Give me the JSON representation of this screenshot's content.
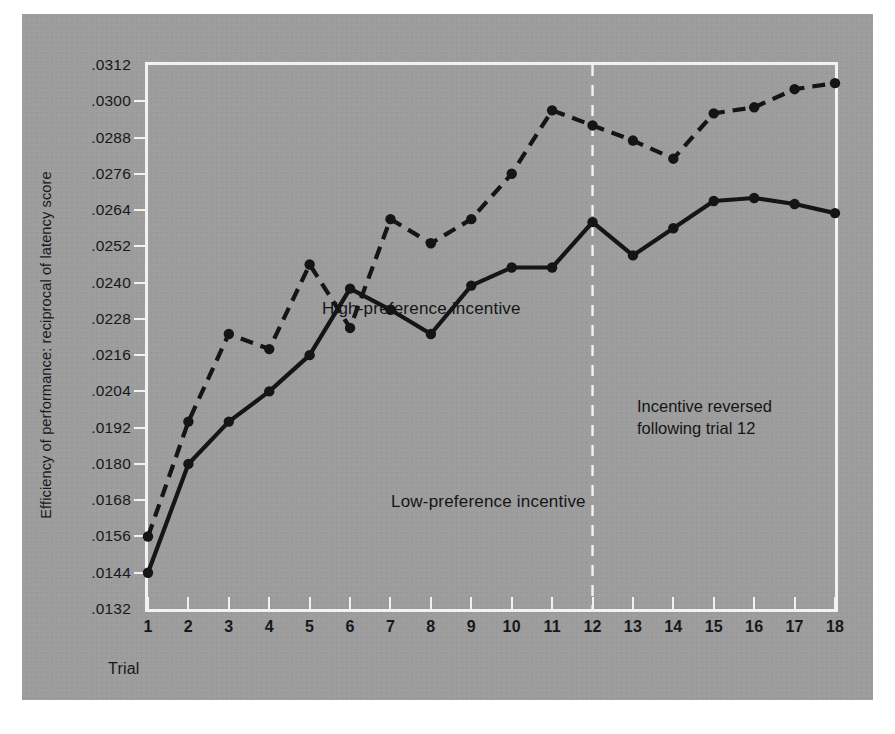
{
  "figure": {
    "background_color": "#9d9d9d",
    "frame_color": "#f2f2f2",
    "ink_color": "#141517"
  },
  "annotations": {
    "high_series_note": "High-preference incentive",
    "low_series_note": "Low-preference incentive",
    "reversal_line1": "Incentive reversed",
    "reversal_line2": "following trial 12",
    "reversal_trial": 12
  },
  "chart_data": {
    "type": "line",
    "title": "",
    "xlabel": "Trial",
    "ylabel": "Efficiency of performance: reciprocal of latency score",
    "x": [
      1,
      2,
      3,
      4,
      5,
      6,
      7,
      8,
      9,
      10,
      11,
      12,
      13,
      14,
      15,
      16,
      17,
      18
    ],
    "xticklabels": [
      "1",
      "2",
      "3",
      "4",
      "5",
      "6",
      "7",
      "8",
      "9",
      "10",
      "11",
      "12",
      "13",
      "14",
      "15",
      "16",
      "17",
      "18"
    ],
    "xlim": [
      1,
      18
    ],
    "ylim": [
      0.0132,
      0.0312
    ],
    "yticks": [
      0.0132,
      0.0144,
      0.0156,
      0.0168,
      0.018,
      0.0192,
      0.0204,
      0.0216,
      0.0228,
      0.024,
      0.0252,
      0.0264,
      0.0276,
      0.0288,
      0.03,
      0.0312
    ],
    "yticklabels": [
      ".0132",
      ".0144",
      ".0156",
      ".0168",
      ".0180",
      ".0192",
      ".0204",
      ".0216",
      ".0228",
      ".0240",
      ".0252",
      ".0264",
      ".0276",
      ".0288",
      ".0300",
      ".0312"
    ],
    "grid": false,
    "legend_position": "inline-annotations",
    "series": [
      {
        "name": "High-preference incentive",
        "style": "dashed",
        "marker": "filled-circle",
        "values": [
          0.0156,
          0.0194,
          0.0223,
          0.0218,
          0.0246,
          0.0225,
          0.0261,
          0.0253,
          0.0261,
          0.0276,
          0.0297,
          0.0292,
          0.0287,
          0.0281,
          0.0296,
          0.0298,
          0.0304,
          0.0306
        ]
      },
      {
        "name": "Low-preference incentive",
        "style": "solid",
        "marker": "filled-circle",
        "values": [
          0.0144,
          0.018,
          0.0194,
          0.0204,
          0.0216,
          0.0238,
          0.0231,
          0.0223,
          0.0239,
          0.0245,
          0.0245,
          0.026,
          0.0249,
          0.0258,
          0.0267,
          0.0268,
          0.0266,
          0.0263
        ]
      }
    ],
    "reference_line": {
      "orientation": "vertical",
      "x": 12,
      "style": "dashed",
      "color": "#f2f2f2",
      "label": "Incentive reversed following trial 12"
    }
  }
}
